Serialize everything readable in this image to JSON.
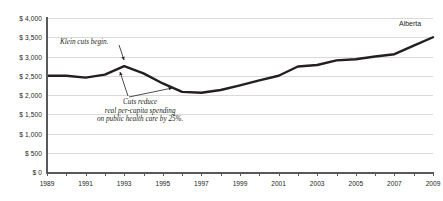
{
  "chart_data": {
    "type": "line",
    "title": "",
    "xlabel": "",
    "ylabel": "",
    "xlim": [
      1989,
      2009
    ],
    "ylim": [
      0,
      4000
    ],
    "grid": true,
    "legend_position": "inline-right",
    "y_tick_labels": [
      "$ 4,000",
      "$ 3,500",
      "$ 3,000",
      "$ 2,500",
      "$ 2,000",
      "$ 1,500",
      "$ 1,000",
      "$ 500",
      "$ 0"
    ],
    "y_tick_values": [
      4000,
      3500,
      3000,
      2500,
      2000,
      1500,
      1000,
      500,
      0
    ],
    "x_tick_labels": [
      "1989",
      "1991",
      "1993",
      "1995",
      "1997",
      "1999",
      "2001",
      "2003",
      "2005",
      "2007",
      "2009"
    ],
    "x_tick_values": [
      1989,
      1991,
      1993,
      1995,
      1997,
      1999,
      2001,
      2003,
      2005,
      2007,
      2009
    ],
    "x_minor_ticks": [
      1989,
      1990,
      1991,
      1992,
      1993,
      1994,
      1995,
      1996,
      1997,
      1998,
      1999,
      2000,
      2001,
      2002,
      2003,
      2004,
      2005,
      2006,
      2007,
      2008,
      2009
    ],
    "series": [
      {
        "name": "Alberta",
        "color": "#231f20",
        "x": [
          1989,
          1990,
          1991,
          1992,
          1993,
          1994,
          1995,
          1996,
          1997,
          1998,
          1999,
          2000,
          2001,
          2002,
          2003,
          2004,
          2005,
          2006,
          2007,
          2008,
          2009
        ],
        "values": [
          2500,
          2500,
          2450,
          2530,
          2750,
          2560,
          2300,
          2080,
          2060,
          2130,
          2250,
          2380,
          2500,
          2740,
          2780,
          2900,
          2930,
          3000,
          3060,
          3280,
          3500
        ]
      }
    ],
    "annotations": [
      {
        "id": "klein-cuts",
        "text": "Klein cuts begin.",
        "lines": [
          "Klein cuts begin."
        ],
        "points_to": {
          "x": 1993,
          "y": 2750
        }
      },
      {
        "id": "cuts-reduce",
        "text": "Cuts reduce real per-capita spending on public health care by 25%.",
        "lines": [
          "Cuts reduce",
          "real per-capita spending",
          "on public health care by 25%."
        ],
        "points_to": [
          {
            "x": 1993,
            "y": 2700
          },
          {
            "x": 1996,
            "y": 2080
          }
        ]
      }
    ],
    "colors": {
      "line": "#231f20",
      "grid": "#d9d9d9",
      "axis": "#58595b",
      "text": "#231f20",
      "background": "#ffffff"
    }
  }
}
